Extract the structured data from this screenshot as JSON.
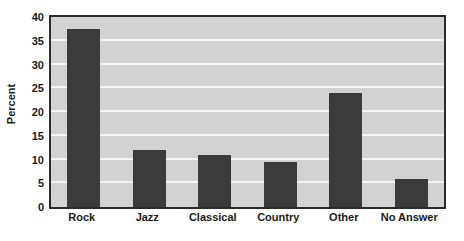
{
  "chart_data": {
    "type": "bar",
    "title": "",
    "subtitle": "",
    "xlabel": "",
    "ylabel": "Percent",
    "categories": [
      "Rock",
      "Jazz",
      "Classical",
      "Country",
      "Other",
      "No Answer"
    ],
    "values": [
      37.5,
      12,
      11,
      9.5,
      24,
      6
    ],
    "series": [
      {
        "name": "Percent",
        "values": [
          37.5,
          12,
          11,
          9.5,
          24,
          6
        ]
      }
    ],
    "ylim": [
      0,
      40
    ],
    "yticks": [
      0,
      5,
      10,
      15,
      20,
      25,
      30,
      35,
      40
    ],
    "ytick_labels": [
      "0",
      "5",
      "10",
      "15",
      "20",
      "25",
      "30",
      "35",
      "40"
    ],
    "grid": true,
    "grid_axis": "y",
    "legend": false,
    "legend_position": "none",
    "annotations": [],
    "colors": {
      "bar": "#3b3b3b",
      "plot_background": "#d2d2d2",
      "gridline": "#f4f4f4",
      "frame": "#2b2b2b",
      "text": "#1a1a1a",
      "page_background": "#ffffff"
    }
  }
}
